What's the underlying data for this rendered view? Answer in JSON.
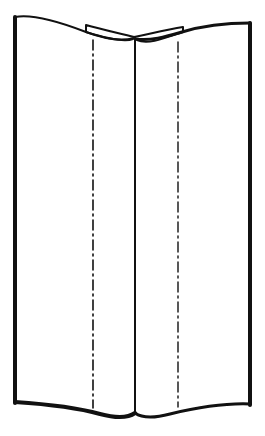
{
  "figure": {
    "stroke_color": "#111111",
    "background_color": "#ffffff",
    "parts": [
      "left-cover-edge",
      "right-cover-edge",
      "top-edge",
      "bottom-edge",
      "spine-fold",
      "spine-tab",
      "left-fold-line",
      "right-fold-line"
    ]
  }
}
